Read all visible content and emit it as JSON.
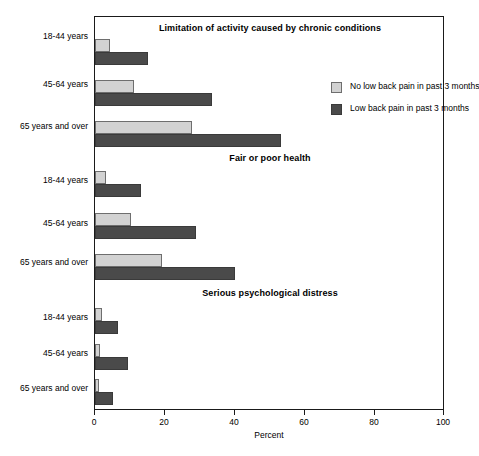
{
  "chart_data": {
    "type": "bar",
    "orientation": "horizontal",
    "title": "",
    "xlabel": "Percent",
    "ylabel": "",
    "xlim": [
      0,
      100
    ],
    "xticks": [
      0,
      20,
      40,
      60,
      80,
      100
    ],
    "xtick_labels": [
      "0",
      "20",
      "40",
      "60",
      "80",
      "100"
    ],
    "grid": false,
    "legend_position": "upper right (inside panel 1)",
    "categories": [
      "18-44 years",
      "45-64 years",
      "65 years and over"
    ],
    "legend": [
      "No low back pain in past 3 months",
      "Low back pain in past 3 months"
    ],
    "panels": [
      {
        "title": "Limitation of activity caused by chronic conditions",
        "series": [
          {
            "name": "No low back pain in past 3 months",
            "values": [
              4.3,
              11.0,
              27.7
            ]
          },
          {
            "name": "Low back pain in past 3 months",
            "values": [
              15.0,
              33.5,
              53.0
            ]
          }
        ]
      },
      {
        "title": "Fair or poor health",
        "series": [
          {
            "name": "No low back pain in past 3 months",
            "values": [
              3.1,
              10.3,
              19.1
            ]
          },
          {
            "name": "Low back pain in past 3 months",
            "values": [
              13.1,
              28.9,
              40.0
            ]
          }
        ]
      },
      {
        "title": "Serious psychological distress",
        "series": [
          {
            "name": "No low back pain in past 3 months",
            "values": [
              2.0,
              1.5,
              1.0
            ]
          },
          {
            "name": "Low back pain in past 3 months",
            "values": [
              6.6,
              9.5,
              5.0
            ]
          }
        ]
      }
    ],
    "colors": {
      "no_low_back_pain": "#d2d2d2",
      "low_back_pain": "#4a4a4a",
      "axis": "#1a1a1a",
      "background": "#ffffff"
    }
  },
  "axis": {
    "x_title": "Percent",
    "ticks": [
      "0",
      "20",
      "40",
      "60",
      "80",
      "100"
    ]
  },
  "legend": {
    "items": [
      {
        "label": "No low back pain in past 3 months",
        "swatch": "light"
      },
      {
        "label": "Low back pain in past 3 months",
        "swatch": "dark"
      }
    ]
  },
  "panels": [
    {
      "title": "Limitation of activity caused by chronic conditions",
      "rows": [
        {
          "label": "18-44 years",
          "light": 4.3,
          "dark": 15.0
        },
        {
          "label": "45-64 years",
          "light": 11.0,
          "dark": 33.5
        },
        {
          "label": "65 years and over",
          "light": 27.7,
          "dark": 53.0
        }
      ]
    },
    {
      "title": "Fair or poor health",
      "rows": [
        {
          "label": "18-44 years",
          "light": 3.1,
          "dark": 13.1
        },
        {
          "label": "45-64 years",
          "light": 10.3,
          "dark": 28.9
        },
        {
          "label": "65 years and over",
          "light": 19.1,
          "dark": 40.0
        }
      ]
    },
    {
      "title": "Serious psychological distress",
      "rows": [
        {
          "label": "18-44 years",
          "light": 2.0,
          "dark": 6.6
        },
        {
          "label": "45-64 years",
          "light": 1.5,
          "dark": 9.5
        },
        {
          "label": "65 years and over",
          "label_alt": "",
          "light": 1.0,
          "dark": 5.0
        }
      ]
    }
  ]
}
